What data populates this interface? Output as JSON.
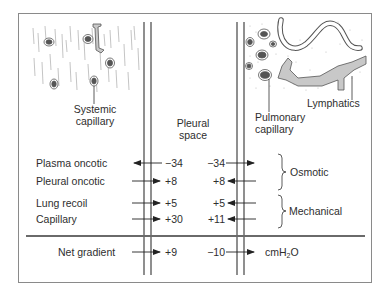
{
  "regions": {
    "systemic": {
      "label_line1": "Systemic",
      "label_line2": "capillary"
    },
    "pleural": {
      "label_line1": "Pleural",
      "label_line2": "space"
    },
    "pulmonary": {
      "label_line1": "Pulmonary",
      "label_line2": "capillary"
    },
    "lymphatics": {
      "label": "Lymphatics"
    }
  },
  "forces": [
    {
      "name": "Plasma oncotic",
      "left_value": "−34",
      "right_value": "−34",
      "left_dir": "out",
      "right_dir": "in"
    },
    {
      "name": "Pleural oncotic",
      "left_value": "+8",
      "right_value": "+8",
      "left_dir": "in",
      "right_dir": "out"
    },
    {
      "name": "Lung recoil",
      "left_value": "+5",
      "right_value": "+5",
      "left_dir": "in",
      "right_dir": "out"
    },
    {
      "name": "Capillary",
      "left_value": "+30",
      "right_value": "+11",
      "left_dir": "in",
      "right_dir": "out"
    }
  ],
  "groups": {
    "osmotic": "Osmotic",
    "mechanical": "Mechanical"
  },
  "net": {
    "name": "Net gradient",
    "left_value": "+9",
    "right_value": "−10",
    "unit_main": "cmH",
    "unit_sub": "2",
    "unit_end": "O"
  },
  "colors": {
    "line": "#333333",
    "frame": "#8a8a8a",
    "vessel_fill": "#c8c8c8",
    "nucleus": "#555555",
    "divider": "#6a6a6a"
  }
}
